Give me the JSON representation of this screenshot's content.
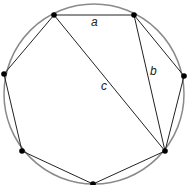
{
  "diagram": {
    "circle": {
      "cx": 94,
      "cy": 94,
      "r": 90,
      "stroke": "#8a8a8a",
      "stroke_width": 1.5
    },
    "polygon_stroke": "#222222",
    "vertex_color": "#000000",
    "vertices": [
      {
        "id": "v1",
        "x": 54,
        "y": 15
      },
      {
        "id": "v2",
        "x": 134,
        "y": 15
      },
      {
        "id": "v3",
        "x": 184,
        "y": 76
      },
      {
        "id": "v4",
        "x": 165,
        "y": 151
      },
      {
        "id": "v5",
        "x": 93,
        "y": 184
      },
      {
        "id": "v6",
        "x": 22,
        "y": 151
      },
      {
        "id": "v7",
        "x": 4,
        "y": 74
      }
    ],
    "diagonals": [
      {
        "name": "b",
        "from": "v2",
        "to": "v4"
      },
      {
        "name": "c",
        "from": "v1",
        "to": "v4"
      }
    ],
    "labels": [
      {
        "text": "a",
        "x": 91,
        "y": 26,
        "refers_to": "side v1-v2"
      },
      {
        "text": "b",
        "x": 150,
        "y": 75,
        "refers_to": "diagonal v2-v4"
      },
      {
        "text": "c",
        "x": 101,
        "y": 90,
        "refers_to": "diagonal v1-v4"
      }
    ]
  }
}
